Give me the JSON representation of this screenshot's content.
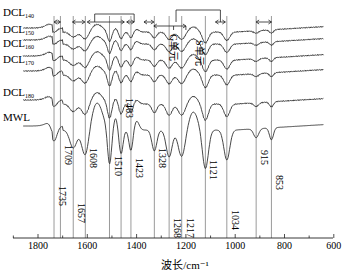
{
  "chart_data": {
    "type": "line",
    "title": "",
    "xlabel": "波长/cm⁻¹",
    "ylabel": "",
    "xlim": [
      1900,
      600
    ],
    "x_reversed": true,
    "xticks": [
      1800,
      1600,
      1400,
      1200,
      1000,
      800,
      600
    ],
    "xtick_labels": [
      "1800",
      "1600",
      "1400",
      "1200",
      "1000",
      "800",
      "600"
    ],
    "grid": false,
    "legend_position": "inline-left",
    "series": [
      {
        "name": "DCL140",
        "label_main": "DCL",
        "label_sub": "140",
        "offset": 0
      },
      {
        "name": "DCL150",
        "label_main": "DCL",
        "label_sub": "150",
        "offset": 1
      },
      {
        "name": "DCL160",
        "label_main": "DCL",
        "label_sub": "160",
        "offset": 2
      },
      {
        "name": "DCL170",
        "label_main": "DCL",
        "label_sub": "170",
        "offset": 3
      },
      {
        "name": "DCL180",
        "label_main": "DCL",
        "label_sub": "180",
        "offset": 4
      },
      {
        "name": "MWL",
        "label_main": "MWL",
        "label_sub": "",
        "offset": 5
      }
    ],
    "reference_lines": [
      1735,
      1709,
      1657,
      1608,
      1510,
      1463,
      1423,
      1328,
      1268,
      1217,
      1121,
      1034,
      915,
      853
    ],
    "annotations": [
      {
        "text": "1735",
        "x": 1735
      },
      {
        "text": "1709",
        "x": 1709
      },
      {
        "text": "1657",
        "x": 1657
      },
      {
        "text": "1608",
        "x": 1608
      },
      {
        "text": "1510",
        "x": 1510
      },
      {
        "text": "1463",
        "x": 1463
      },
      {
        "text": "1423",
        "x": 1423
      },
      {
        "text": "1328",
        "x": 1328
      },
      {
        "text": "1268",
        "x": 1268
      },
      {
        "text": "1217",
        "x": 1217
      },
      {
        "text": "1121",
        "x": 1121
      },
      {
        "text": "1034",
        "x": 1034
      },
      {
        "text": "915",
        "x": 915
      },
      {
        "text": "853",
        "x": 853
      },
      {
        "text": "G单元",
        "x": 1250
      },
      {
        "text": "S单元",
        "x": 1140
      }
    ],
    "range_brackets": [
      {
        "from": 1709,
        "to": 1735
      },
      {
        "from": 1610,
        "to": 1660
      },
      {
        "from": 1450,
        "to": 1600
      },
      {
        "from": 1410,
        "to": 1440
      },
      {
        "from": 1330,
        "to": 1370
      },
      {
        "from": 1200,
        "to": 1330
      },
      {
        "from": 1040,
        "to": 1080
      },
      {
        "from": 853,
        "to": 915
      }
    ]
  }
}
